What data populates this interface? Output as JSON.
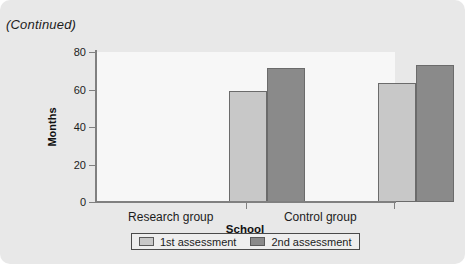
{
  "caption": "(Continued)",
  "colors": {
    "card_background": "#e8e8e8",
    "plot_background": "#f7f7f7",
    "series1_fill": "#c8c8c8",
    "series2_fill": "#8a8a8a",
    "bar_outline": "#6b6b6b",
    "axis": "#808080",
    "text": "#1c1c1c"
  },
  "chart_data": {
    "type": "bar",
    "title": "",
    "subtitle": "",
    "xlabel": "School",
    "ylabel": "Months",
    "categories": [
      "Research group",
      "Control group"
    ],
    "series": [
      {
        "name": "1st assessment",
        "values": [
          59,
          63.5
        ],
        "color": "#c8c8c8"
      },
      {
        "name": "2nd assessment",
        "values": [
          71.5,
          73
        ],
        "color": "#8a8a8a"
      }
    ],
    "ylim": [
      0,
      80
    ],
    "yticks": [
      0,
      20,
      40,
      60,
      80
    ],
    "ytick_labels": [
      "0",
      "20",
      "40",
      "60",
      "80"
    ],
    "grid": false,
    "legend_position": "bottom"
  }
}
